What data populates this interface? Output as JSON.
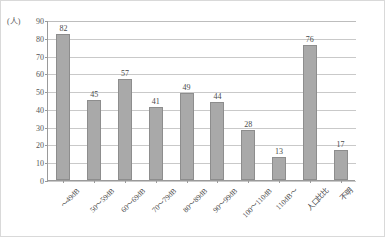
{
  "chart_data": {
    "type": "bar",
    "title": "",
    "subtitle": "",
    "xlabel": "",
    "ylabel": "(人)",
    "ylim": [
      0,
      90
    ],
    "ytick_step": 10,
    "grid": true,
    "legend": "none",
    "bar_color": "#a9a9a9",
    "bar_border_color": "#8d8d8d",
    "gridline_color": "#c9c9c9",
    "axis_color": "#9a9a9a",
    "yticks": [
      "90",
      "80",
      "70",
      "60",
      "50",
      "40",
      "30",
      "20",
      "10",
      "0"
    ],
    "categories": [
      "～49dB",
      "50～59dB",
      "60～69dB",
      "70～79dB",
      "80～89dB",
      "90～99dB",
      "100～110dB",
      "110dB～",
      "人口比比",
      "不明"
    ],
    "values": [
      82,
      45,
      57,
      41,
      49,
      44,
      28,
      13,
      76,
      17
    ],
    "value_labels": [
      "82",
      "45",
      "57",
      "41",
      "49",
      "44",
      "28",
      "13",
      "76",
      "17"
    ]
  }
}
